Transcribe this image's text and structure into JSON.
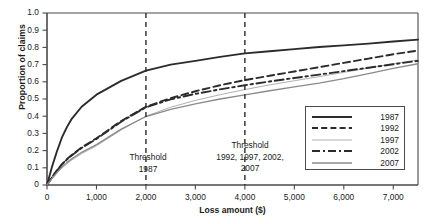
{
  "chart_data": {
    "type": "line",
    "title": "",
    "xlabel": "Loss amount ($)",
    "ylabel": "Proportion of claims",
    "xlim": [
      0,
      7500
    ],
    "ylim": [
      0,
      1.0
    ],
    "grid": false,
    "legend_position": "bottom-right",
    "y_ticks": [
      "1.0",
      "0.9",
      "0.8",
      "0.7",
      "0.6",
      "0.5",
      "0.4",
      "0.3",
      "0.2",
      "0.1",
      "0"
    ],
    "y_tick_values": [
      1.0,
      0.9,
      0.8,
      0.7,
      0.6,
      0.5,
      0.4,
      0.3,
      0.2,
      0.1,
      0
    ],
    "x_ticks": [
      "0",
      "1,000",
      "2,000",
      "3,000",
      "4,000",
      "5,000",
      "6,000",
      "7,000"
    ],
    "x_tick_values": [
      0,
      1000,
      2000,
      3000,
      4000,
      5000,
      6000,
      7000
    ],
    "x": [
      0,
      100,
      200,
      300,
      400,
      500,
      700,
      1000,
      1500,
      2000,
      2500,
      3000,
      3500,
      4000,
      4500,
      5000,
      5500,
      6000,
      6500,
      7000,
      7500
    ],
    "series": [
      {
        "name": "1987",
        "style": "solid-thick-black",
        "color": "#2b2b2b",
        "values": [
          0,
          0.105,
          0.195,
          0.275,
          0.335,
          0.385,
          0.455,
          0.525,
          0.605,
          0.665,
          0.7,
          0.722,
          0.745,
          0.765,
          0.778,
          0.79,
          0.802,
          0.812,
          0.822,
          0.834,
          0.845
        ]
      },
      {
        "name": "1992",
        "style": "dashed-black",
        "color": "#2b2b2b",
        "values": [
          0,
          0.045,
          0.085,
          0.12,
          0.15,
          0.175,
          0.218,
          0.272,
          0.372,
          0.455,
          0.505,
          0.545,
          0.58,
          0.61,
          0.635,
          0.66,
          0.685,
          0.71,
          0.735,
          0.76,
          0.782
        ]
      },
      {
        "name": "1997",
        "style": "solid-thin-light-gray",
        "color": "#b0b0b0",
        "values": [
          0,
          0.035,
          0.068,
          0.098,
          0.122,
          0.145,
          0.182,
          0.228,
          0.32,
          0.4,
          0.452,
          0.492,
          0.525,
          0.555,
          0.582,
          0.606,
          0.63,
          0.655,
          0.68,
          0.705,
          0.728
        ]
      },
      {
        "name": "2002",
        "style": "dash-dot-black",
        "color": "#2b2b2b",
        "values": [
          0,
          0.044,
          0.083,
          0.118,
          0.148,
          0.172,
          0.215,
          0.268,
          0.368,
          0.452,
          0.498,
          0.53,
          0.556,
          0.58,
          0.602,
          0.622,
          0.642,
          0.662,
          0.682,
          0.702,
          0.722
        ]
      },
      {
        "name": "2007",
        "style": "solid-medium-gray",
        "color": "#8a8a8a",
        "values": [
          0,
          0.038,
          0.072,
          0.104,
          0.13,
          0.152,
          0.19,
          0.235,
          0.325,
          0.398,
          0.44,
          0.472,
          0.5,
          0.524,
          0.548,
          0.57,
          0.592,
          0.618,
          0.648,
          0.678,
          0.705
        ]
      }
    ],
    "annotations": [
      {
        "name": "threshold-1987",
        "x_value": 2000,
        "label": "Threshold\n1987",
        "line_style": "dashed",
        "color": "#2b2b2b"
      },
      {
        "name": "threshold-later-years",
        "x_value": 4000,
        "label": "Threshold\n1992, 1997, 2002,\n2007",
        "line_style": "dashed",
        "color": "#2b2b2b"
      }
    ],
    "legend": [
      {
        "label": "1987",
        "swatch": "solid-thick-line"
      },
      {
        "label": "1992",
        "swatch": "dashed-line"
      },
      {
        "label": "1997",
        "swatch": "thin-light-line"
      },
      {
        "label": "2002",
        "swatch": "dash-dot-line"
      },
      {
        "label": "2007",
        "swatch": "solid-gray-line"
      }
    ]
  },
  "axes": {
    "y_title": "Proportion of claims",
    "x_title": "Loss amount ($)"
  },
  "colors": {
    "axis": "#4a4a4a",
    "text": "#1a1a1a",
    "series_1987": "#2b2b2b",
    "series_1992": "#2b2b2b",
    "series_1997": "#b0b0b0",
    "series_2002": "#2b2b2b",
    "series_2007": "#8a8a8a",
    "background": "#ffffff"
  }
}
